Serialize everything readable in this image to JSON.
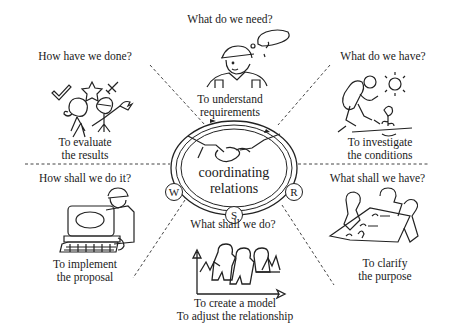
{
  "center": {
    "line1": "coordinating",
    "line2": "relations",
    "badges": {
      "left": "W",
      "right": "R",
      "bottom": "S"
    }
  },
  "sections": {
    "top": {
      "question": "What do we need?",
      "caption1": "To understand",
      "caption2": "requirements",
      "icon": "thinking-worker-icon"
    },
    "top_left": {
      "question": "How have we done?",
      "caption1": "To evaluate",
      "caption2": "the results",
      "icon": "celebrating-people-icon"
    },
    "top_right": {
      "question": "What do we have?",
      "caption1": "To investigate",
      "caption2": "the conditions",
      "icon": "hiker-icon"
    },
    "bottom_left": {
      "question": "How shall we do it?",
      "caption1": "To implement",
      "caption2": "the proposal",
      "icon": "computer-user-icon"
    },
    "bottom_right": {
      "question": "What shall we have?",
      "caption1": "To clarify",
      "caption2": "the purpose",
      "icon": "meeting-table-icon"
    },
    "bottom": {
      "question": "What shall we do?",
      "caption1": "To create a model",
      "caption2": "To adjust the relationship",
      "icon": "model-chart-icon"
    }
  }
}
